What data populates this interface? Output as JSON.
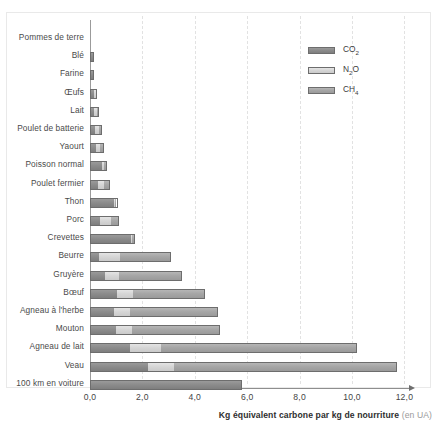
{
  "chart_data": {
    "type": "bar",
    "orientation": "horizontal",
    "stacked": true,
    "title": "",
    "xlabel": "Kg équivalent carbone par kg de nourriture",
    "xlabel_unit": "(en UA)",
    "ylabel": "",
    "xlim": [
      0,
      12.6
    ],
    "grid": true,
    "legend_position": "top-right",
    "xticks": [
      "0,0",
      "2,0",
      "4,0",
      "6,0",
      "8,0",
      "10,0",
      "12,0"
    ],
    "xtick_values": [
      0,
      2,
      4,
      6,
      8,
      10,
      12
    ],
    "legend": [
      {
        "name": "CO2",
        "label_html": "CO₂",
        "color": "#8c8c8c"
      },
      {
        "name": "N2O",
        "label_html": "N₂O",
        "color": "#d6d6d6"
      },
      {
        "name": "CH4",
        "label_html": "CH₄",
        "color": "#a6a6a6"
      }
    ],
    "series": [
      {
        "name": "CO2",
        "color": "#8c8c8c"
      },
      {
        "name": "N2O",
        "color": "#d6d6d6"
      },
      {
        "name": "CH4",
        "color": "#a6a6a6"
      }
    ],
    "categories": [
      "Pommes de terre",
      "Blé",
      "Farine",
      "Œufs",
      "Lait",
      "Poulet de batterie",
      "Yaourt",
      "Poisson normal",
      "Poulet fermier",
      "Thon",
      "Porc",
      "Crevettes",
      "Beurre",
      "Gruyère",
      "Bœuf",
      "Agneau à l'herbe",
      "Mouton",
      "Agneau de lait",
      "Veau",
      "100 km en voiture"
    ],
    "rows": [
      {
        "label": "Pommes de terre",
        "co2": 0.0,
        "n2o": 0.0,
        "ch4": 0.0,
        "total": 0.0
      },
      {
        "label": "Blé",
        "co2": 0.15,
        "n2o": 0.0,
        "ch4": 0.0,
        "total": 0.15
      },
      {
        "label": "Farine",
        "co2": 0.16,
        "n2o": 0.0,
        "ch4": 0.0,
        "total": 0.16
      },
      {
        "label": "Œufs",
        "co2": 0.14,
        "n2o": 0.11,
        "ch4": 0.0,
        "total": 0.25
      },
      {
        "label": "Lait",
        "co2": 0.16,
        "n2o": 0.12,
        "ch4": 0.07,
        "total": 0.35
      },
      {
        "label": "Poulet de batterie",
        "co2": 0.2,
        "n2o": 0.15,
        "ch4": 0.1,
        "total": 0.45
      },
      {
        "label": "Yaourt",
        "co2": 0.24,
        "n2o": 0.17,
        "ch4": 0.14,
        "total": 0.55
      },
      {
        "label": "Poisson normal",
        "co2": 0.48,
        "n2o": 0.1,
        "ch4": 0.07,
        "total": 0.65
      },
      {
        "label": "Poulet fermier",
        "co2": 0.3,
        "n2o": 0.25,
        "ch4": 0.2,
        "total": 0.75
      },
      {
        "label": "Thon",
        "co2": 0.95,
        "n2o": 0.05,
        "ch4": 0.05,
        "total": 1.05
      },
      {
        "label": "Porc",
        "co2": 0.35,
        "n2o": 0.45,
        "ch4": 0.3,
        "total": 1.1
      },
      {
        "label": "Crevettes",
        "co2": 1.6,
        "n2o": 0.05,
        "ch4": 0.05,
        "total": 1.7
      },
      {
        "label": "Beurre",
        "co2": 0.3,
        "n2o": 0.85,
        "ch4": 1.95,
        "total": 3.1
      },
      {
        "label": "Gruyère",
        "co2": 0.55,
        "n2o": 0.55,
        "ch4": 2.4,
        "total": 3.5
      },
      {
        "label": "Bœuf",
        "co2": 1.0,
        "n2o": 0.65,
        "ch4": 2.75,
        "total": 4.4
      },
      {
        "label": "Agneau à l'herbe",
        "co2": 0.9,
        "n2o": 0.6,
        "ch4": 3.4,
        "total": 4.9
      },
      {
        "label": "Mouton",
        "co2": 0.95,
        "n2o": 0.65,
        "ch4": 3.35,
        "total": 4.95
      },
      {
        "label": "Agneau de lait",
        "co2": 1.5,
        "n2o": 1.2,
        "ch4": 7.5,
        "total": 10.2
      },
      {
        "label": "Veau",
        "co2": 2.2,
        "n2o": 1.0,
        "ch4": 8.5,
        "total": 11.7
      },
      {
        "label": "100 km en voiture",
        "co2": 5.8,
        "n2o": 0.0,
        "ch4": 0.0,
        "total": 5.8
      }
    ]
  }
}
